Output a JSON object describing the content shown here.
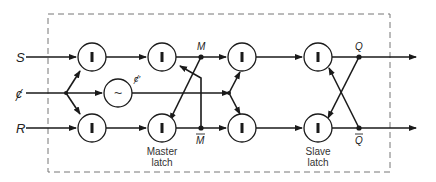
{
  "diagram": {
    "type": "master-slave flip-flop block diagram",
    "inputs": {
      "s": "S",
      "clock": "ȼ",
      "r": "R"
    },
    "clock_inverted_label": "ȼ′",
    "inverter_symbol": "~",
    "gate_symbol": "I",
    "nodes": {
      "m": "M",
      "m_bar": "M",
      "q": "Q",
      "q_bar": "Q"
    },
    "captions": {
      "master_line1": "Master",
      "master_line2": "latch",
      "slave_line1": "Slave",
      "slave_line2": "latch"
    },
    "colors": {
      "stroke": "#1a1a1a",
      "dashed_box": "#666666",
      "background": "#ffffff"
    }
  }
}
